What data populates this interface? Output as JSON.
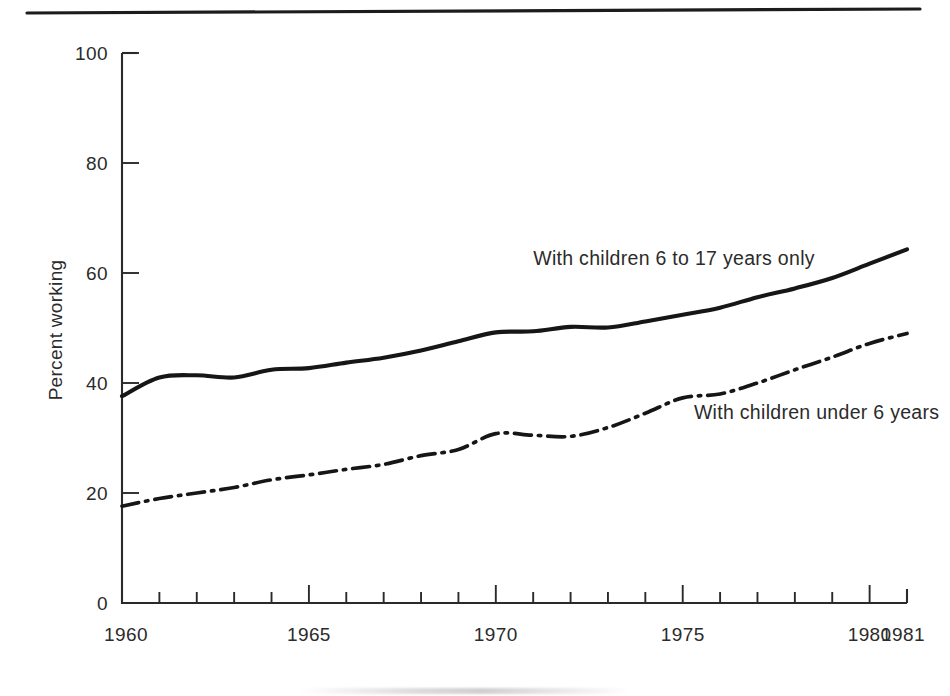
{
  "figure": {
    "top_rule": true,
    "background_color": "#ffffff",
    "ink_color": "#161616"
  },
  "chart_data": {
    "type": "line",
    "title": "",
    "subtitle": "",
    "xlabel": "",
    "ylabel": "Percent working",
    "xlim": [
      1960,
      1981
    ],
    "ylim": [
      0,
      100
    ],
    "grid": false,
    "legend_position": "inline-annotation",
    "y_ticks": [
      0,
      20,
      40,
      60,
      80,
      100
    ],
    "y_tick_labels": [
      "0",
      "20",
      "40",
      "60",
      "80",
      "100"
    ],
    "x_tick_labels": [
      "1960",
      "1965",
      "1970",
      "1975",
      "1980",
      "1981"
    ],
    "x_major_ticks": [
      1965,
      1970,
      1975,
      1980,
      1981
    ],
    "x_minor_ticks": [
      1961,
      1962,
      1963,
      1964,
      1966,
      1967,
      1968,
      1969,
      1971,
      1972,
      1973,
      1974,
      1976,
      1977,
      1978,
      1979
    ],
    "x": [
      1960,
      1961,
      1962,
      1963,
      1964,
      1965,
      1966,
      1967,
      1968,
      1969,
      1970,
      1971,
      1972,
      1973,
      1974,
      1975,
      1976,
      1977,
      1978,
      1979,
      1980,
      1981
    ],
    "series": [
      {
        "name": "With children 6 to 17 years only",
        "style": "solid",
        "label_x": 1971.0,
        "label_y": 61.5,
        "values": [
          37.6,
          41.0,
          41.4,
          41.0,
          42.4,
          42.7,
          43.7,
          44.6,
          45.9,
          47.6,
          49.2,
          49.4,
          50.2,
          50.1,
          51.2,
          52.4,
          53.7,
          55.6,
          57.2,
          59.1,
          61.7,
          64.3
        ]
      },
      {
        "name": "With children under 6 years",
        "style": "dash-dot",
        "label_x": 1975.3,
        "label_y": 33.5,
        "values": [
          17.6,
          19.0,
          20.0,
          21.0,
          22.4,
          23.3,
          24.3,
          25.2,
          26.8,
          27.9,
          30.8,
          30.5,
          30.3,
          31.9,
          34.5,
          37.3,
          38.0,
          40.0,
          42.4,
          44.7,
          47.2,
          49.0
        ]
      }
    ]
  }
}
